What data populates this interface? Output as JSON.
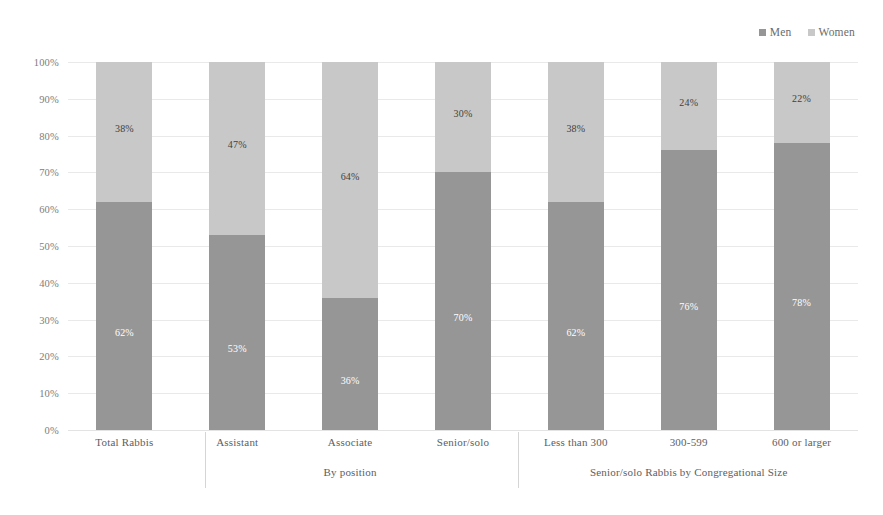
{
  "chart_data": {
    "type": "bar",
    "subtype": "stacked-100-percent",
    "title": "",
    "xlabel": "",
    "ylabel": "",
    "ylim": [
      0,
      100
    ],
    "ytick_labels": [
      "0%",
      "10%",
      "20%",
      "30%",
      "40%",
      "50%",
      "60%",
      "70%",
      "80%",
      "90%",
      "100%"
    ],
    "ytick_values": [
      0,
      10,
      20,
      30,
      40,
      50,
      60,
      70,
      80,
      90,
      100
    ],
    "grid": true,
    "legend_position": "top-right",
    "categories": [
      "Total Rabbis",
      "Assistant",
      "Associate",
      "Senior/solo",
      "Less than 300",
      "300-599",
      "600 or larger"
    ],
    "series": [
      {
        "name": "Men",
        "color": "#969696",
        "values": [
          62,
          53,
          36,
          70,
          62,
          76,
          78
        ],
        "labels": [
          "62%",
          "53%",
          "36%",
          "70%",
          "62%",
          "76%",
          "78%"
        ]
      },
      {
        "name": "Women",
        "color": "#c8c8c8",
        "values": [
          38,
          47,
          64,
          30,
          38,
          24,
          22
        ],
        "labels": [
          "38%",
          "47%",
          "64%",
          "30%",
          "38%",
          "24%",
          "22%"
        ]
      }
    ],
    "group_labels": [
      {
        "text": "By position",
        "categories": [
          "Assistant",
          "Associate",
          "Senior/solo"
        ]
      },
      {
        "text": "Senior/solo Rabbis by Congregational Size",
        "categories": [
          "Less than 300",
          "300-599",
          "600 or larger"
        ]
      }
    ]
  },
  "legend": {
    "entries": [
      {
        "label": "Men",
        "color": "#969696"
      },
      {
        "label": "Women",
        "color": "#c8c8c8"
      }
    ]
  },
  "colors": {
    "men": "#969696",
    "women": "#c8c8c8",
    "grid": "#e9e9e9",
    "separator": "#d5d5d5",
    "background": "#ffffff",
    "axis_text": "#5e5e5e"
  }
}
